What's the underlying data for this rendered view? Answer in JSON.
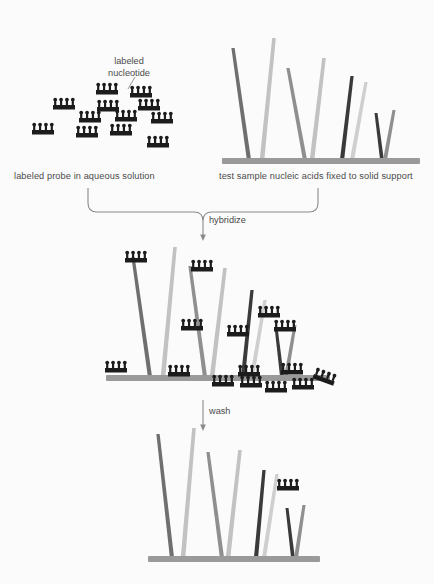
{
  "figure": {
    "title_visible": false,
    "background": "#fbfbfb"
  },
  "labels": {
    "nucleotide": "labeled\nnucleotide",
    "nucleotide_line1": "labeled",
    "nucleotide_line2": "nucleotide",
    "probe_panel": "labeled probe in aqueous solution",
    "sample_panel": "test sample nucleic acids fixed to solid support",
    "hybridize": "hybridize",
    "wash": "wash"
  },
  "colors": {
    "background": "#fbfbfb",
    "probe_dark": "#1c1c1c",
    "support_bar": "#9a9a9a",
    "bracket": "#8a8a8a",
    "arrow": "#8a8a8a",
    "text": "#4a4a4a",
    "strand_dark_grey": "#6f6f6f",
    "strand_light_grey": "#c2c2c2",
    "strand_black": "#3a3a3a",
    "strand_mid_grey": "#8f8f8f",
    "strand_pale": "#cfcfcf"
  },
  "probe_solution": {
    "description": "free labeled probes floating in solution",
    "count": 12,
    "probes": [
      {
        "x": 96,
        "y": 90
      },
      {
        "x": 130,
        "y": 93
      },
      {
        "x": 53,
        "y": 105
      },
      {
        "x": 97,
        "y": 107
      },
      {
        "x": 138,
        "y": 106
      },
      {
        "x": 79,
        "y": 118
      },
      {
        "x": 115,
        "y": 117
      },
      {
        "x": 151,
        "y": 119
      },
      {
        "x": 32,
        "y": 130
      },
      {
        "x": 76,
        "y": 133
      },
      {
        "x": 110,
        "y": 131
      },
      {
        "x": 147,
        "y": 143
      }
    ]
  },
  "sample_panel": {
    "support_bar": {
      "x1": 222,
      "x2": 420,
      "y": 158,
      "thickness": 6
    },
    "strands": [
      {
        "id": "s1",
        "color_key": "strand_dark_grey",
        "x_base": 249,
        "x_top": 233,
        "y_top": 48,
        "width": 4.2
      },
      {
        "id": "s2",
        "color_key": "strand_light_grey",
        "x_base": 262,
        "x_top": 274,
        "y_top": 38,
        "width": 4.6
      },
      {
        "id": "s3",
        "color_key": "strand_mid_grey",
        "x_base": 305,
        "x_top": 288,
        "y_top": 68,
        "width": 4.2
      },
      {
        "id": "s4",
        "color_key": "strand_light_grey",
        "x_base": 312,
        "x_top": 324,
        "y_top": 58,
        "width": 4.6
      },
      {
        "id": "s5",
        "color_key": "strand_black",
        "x_base": 342,
        "x_top": 352,
        "y_top": 76,
        "width": 4.2
      },
      {
        "id": "s6",
        "color_key": "strand_pale",
        "x_base": 352,
        "x_top": 366,
        "y_top": 82,
        "width": 4.2
      },
      {
        "id": "s7",
        "color_key": "strand_black",
        "x_base": 382,
        "x_top": 376,
        "y_top": 113,
        "width": 3.8
      },
      {
        "id": "s8",
        "color_key": "strand_mid_grey",
        "x_base": 385,
        "x_top": 394,
        "y_top": 110,
        "width": 4.0
      }
    ]
  },
  "hybridize_panel": {
    "support_bar": {
      "x1": 106,
      "x2": 330,
      "y": 375,
      "thickness": 6
    },
    "strands": [
      {
        "id": "h1",
        "color_key": "strand_dark_grey",
        "x_base": 150,
        "x_top": 133,
        "y_top": 257,
        "width": 4.2,
        "probe_at_top": true
      },
      {
        "id": "h2",
        "color_key": "strand_light_grey",
        "x_base": 163,
        "x_top": 175,
        "y_top": 247,
        "width": 4.6,
        "probe_at_top": false
      },
      {
        "id": "h3",
        "color_key": "strand_mid_grey",
        "x_base": 205,
        "x_top": 190,
        "y_top": 266,
        "width": 4.2,
        "probe_at_top": true
      },
      {
        "id": "h4",
        "color_key": "strand_light_grey",
        "x_base": 212,
        "x_top": 225,
        "y_top": 268,
        "width": 4.6,
        "probe_at_top": false
      },
      {
        "id": "h5",
        "color_key": "strand_black",
        "x_base": 243,
        "x_top": 252,
        "y_top": 290,
        "width": 4.2,
        "probe_at_top": false
      },
      {
        "id": "h6",
        "color_key": "strand_pale",
        "x_base": 252,
        "x_top": 265,
        "y_top": 300,
        "width": 4.2,
        "probe_at_top": false
      },
      {
        "id": "h7",
        "color_key": "strand_black",
        "x_base": 282,
        "x_top": 276,
        "y_top": 327,
        "width": 3.8,
        "probe_at_top": true
      },
      {
        "id": "h8",
        "color_key": "strand_mid_grey",
        "x_base": 286,
        "x_top": 295,
        "y_top": 325,
        "width": 4.0,
        "probe_at_top": false
      }
    ],
    "bound_probes": [
      {
        "x": 125,
        "y": 258,
        "rot": 0,
        "note": "top of strand h1"
      },
      {
        "x": 191,
        "y": 267,
        "rot": 0,
        "note": "top of strand h3"
      },
      {
        "x": 181,
        "y": 326,
        "rot": 0,
        "note": "mid strand"
      },
      {
        "x": 227,
        "y": 332,
        "rot": 0,
        "note": "mid strand"
      },
      {
        "x": 258,
        "y": 313,
        "rot": 0,
        "note": "mid strand"
      },
      {
        "x": 274,
        "y": 327,
        "rot": 0,
        "note": "top of strand h7"
      }
    ],
    "unbound_probes": [
      {
        "x": 105,
        "y": 368,
        "rot": 0
      },
      {
        "x": 168,
        "y": 372,
        "rot": 0
      },
      {
        "x": 212,
        "y": 382,
        "rot": 0
      },
      {
        "x": 238,
        "y": 372,
        "rot": 0
      },
      {
        "x": 240,
        "y": 383,
        "rot": 0
      },
      {
        "x": 265,
        "y": 388,
        "rot": 0
      },
      {
        "x": 281,
        "y": 370,
        "rot": 0
      },
      {
        "x": 292,
        "y": 385,
        "rot": 0
      },
      {
        "x": 314,
        "y": 374,
        "rot": 20
      }
    ]
  },
  "wash_panel": {
    "support_bar": {
      "x1": 148,
      "x2": 320,
      "y": 556,
      "thickness": 6
    },
    "strands": [
      {
        "id": "w1",
        "color_key": "strand_dark_grey",
        "x_base": 172,
        "x_top": 158,
        "y_top": 434,
        "width": 4.2,
        "probe_at_top": false
      },
      {
        "id": "w2",
        "color_key": "strand_light_grey",
        "x_base": 183,
        "x_top": 194,
        "y_top": 428,
        "width": 4.6,
        "probe_at_top": false
      },
      {
        "id": "w3",
        "color_key": "strand_mid_grey",
        "x_base": 222,
        "x_top": 208,
        "y_top": 452,
        "width": 4.2,
        "probe_at_top": false
      },
      {
        "id": "w4",
        "color_key": "strand_light_grey",
        "x_base": 228,
        "x_top": 240,
        "y_top": 450,
        "width": 4.6,
        "probe_at_top": false
      },
      {
        "id": "w5",
        "color_key": "strand_black",
        "x_base": 256,
        "x_top": 264,
        "y_top": 470,
        "width": 4.2,
        "probe_at_top": false
      },
      {
        "id": "w6",
        "color_key": "strand_pale",
        "x_base": 264,
        "x_top": 277,
        "y_top": 474,
        "width": 4.2,
        "probe_at_top": true
      },
      {
        "id": "w7",
        "color_key": "strand_black",
        "x_base": 293,
        "x_top": 287,
        "y_top": 508,
        "width": 3.8,
        "probe_at_top": false
      },
      {
        "id": "w8",
        "color_key": "strand_mid_grey",
        "x_base": 296,
        "x_top": 304,
        "y_top": 505,
        "width": 4.0,
        "probe_at_top": false
      }
    ],
    "bound_probes": [
      {
        "x": 277,
        "y": 486,
        "rot": 0,
        "note": "retained hybridized probe"
      }
    ]
  },
  "connectors": {
    "nucleotide_pointer": {
      "x1": 135,
      "y1": 77,
      "x2": 128,
      "y2": 89
    },
    "bracket": {
      "left": 88,
      "right": 318,
      "top": 188,
      "bottom": 212,
      "stem_x": 203,
      "stem_bottom": 238
    },
    "wash_arrow": {
      "x": 203,
      "y1": 400,
      "y2": 428
    }
  },
  "probe_glyph": {
    "bar_width": 22,
    "bar_height": 4.5,
    "tick_count": 4,
    "tick_width": 2.2,
    "tick_height": 5.5,
    "color": "#1c1c1c"
  }
}
